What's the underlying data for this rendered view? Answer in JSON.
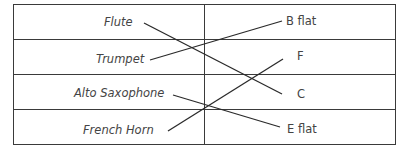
{
  "instruments": [
    {
      "label": "Flute"
    },
    {
      "label": "Trumpet"
    },
    {
      "label": "Alto Saxophone"
    },
    {
      "label": "French Horn"
    }
  ],
  "keys": [
    {
      "label": "B flat"
    },
    {
      "label": "F"
    },
    {
      "label": "C"
    },
    {
      "label": "E flat"
    }
  ],
  "matches": [
    {
      "from": "Flute",
      "to": "C"
    },
    {
      "from": "Trumpet",
      "to": "B flat"
    },
    {
      "from": "Alto Saxophone",
      "to": "E flat"
    },
    {
      "from": "French Horn",
      "to": "F"
    }
  ],
  "colors": {
    "line": "#2a2a2a",
    "text": "#444444",
    "border": "#3a3a3a"
  }
}
